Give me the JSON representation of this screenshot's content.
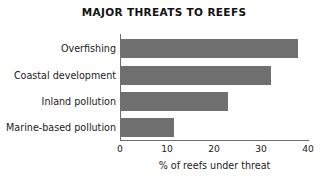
{
  "chart_data": {
    "type": "bar",
    "orientation": "horizontal",
    "title": "MAJOR THREATS TO REEFS",
    "categories": [
      "Overfishing",
      "Coastal development",
      "Inland pollution",
      "Marine-based pollution"
    ],
    "values": [
      37.8,
      32.2,
      23,
      11.5
    ],
    "series": [
      {
        "name": "% of reefs under threat",
        "values": [
          37.8,
          32.2,
          23,
          11.5
        ]
      }
    ],
    "xlabel": "% of reefs under threat",
    "ylabel": "",
    "xlim": [
      0,
      40
    ],
    "xticks": [
      0,
      10,
      20,
      30,
      40
    ],
    "xtick_labels": [
      "0",
      "10",
      "20",
      "30",
      "40"
    ],
    "grid": false,
    "legend": false,
    "bar_color": "#6f6f6f",
    "axis_color": "#6d6d6d",
    "text_color": "#1b1b1b",
    "background": "#ffffff"
  }
}
